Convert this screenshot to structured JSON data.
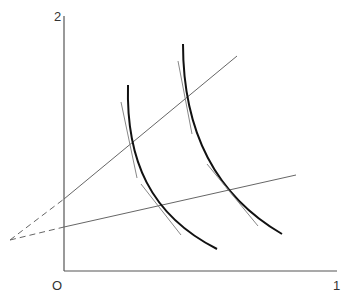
{
  "diagram": {
    "type": "indifference-curves-with-rays",
    "axes": {
      "y_label": "2",
      "x_label": "1",
      "origin_label": "O"
    },
    "elements": {
      "rays": [
        "upper ray from external point",
        "lower ray from external point"
      ],
      "curves": [
        "inner convex curve",
        "outer convex curve"
      ],
      "tangents": "short tangent segments at each ray-curve intersection"
    },
    "colors": {
      "axis": "#555555",
      "ray": "#666666",
      "curve": "#111111",
      "tangent": "#888888"
    }
  }
}
